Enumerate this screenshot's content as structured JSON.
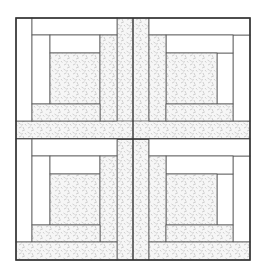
{
  "figure": {
    "colors": {
      "background": "#ffffff",
      "outline": "#333333",
      "plain_fabric": "#ffffff",
      "print_fabric_base": "#f4f4f4",
      "print_fabric_marks": "#b8b8b8"
    },
    "outer": {
      "x": 16,
      "y": 18,
      "w": 234,
      "h": 242
    },
    "blocks": [
      {
        "name": "top-left",
        "x": 16,
        "y": 18
      },
      {
        "name": "top-right",
        "x": 149,
        "y": 18
      },
      {
        "name": "bottom-left",
        "x": 16,
        "y": 139
      },
      {
        "name": "bottom-right",
        "x": 149,
        "y": 139
      }
    ]
  }
}
